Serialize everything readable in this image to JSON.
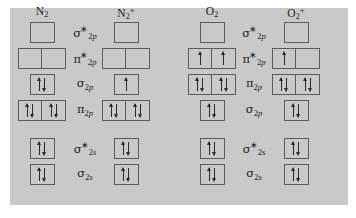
{
  "figure": {
    "type": "molecular-orbital-diagram",
    "background_color": "#ffffff",
    "panel_color": "#c9c9c9",
    "box_border_color": "#5c5c5c",
    "arrow_color": "#2a2a2a"
  },
  "groups": [
    {
      "id": "left",
      "species": [
        {
          "id": "n2",
          "base": "N",
          "sub": "2",
          "sup": ""
        },
        {
          "id": "n2plus",
          "base": "N",
          "sub": "2",
          "sup": "+"
        }
      ],
      "rows": [
        {
          "id": "sigma-star-2p",
          "label": {
            "symbol": "σ",
            "star": "∗",
            "sub_n": "2",
            "sub_l": "p"
          },
          "boxes": {
            "n2": [
              []
            ],
            "n2plus": [
              []
            ]
          }
        },
        {
          "id": "pi-star-2p",
          "label": {
            "symbol": "π",
            "star": "∗",
            "sub_n": "2",
            "sub_l": "p"
          },
          "boxes": {
            "n2": [
              [],
              []
            ],
            "n2plus": [
              [],
              []
            ]
          }
        },
        {
          "id": "sigma-2p",
          "label": {
            "symbol": "σ",
            "star": "",
            "sub_n": "2",
            "sub_l": "p"
          },
          "boxes": {
            "n2": [
              [
                "up",
                "down"
              ]
            ],
            "n2plus": [
              [
                "up"
              ]
            ]
          }
        },
        {
          "id": "pi-2p",
          "label": {
            "symbol": "π",
            "star": "",
            "sub_n": "2",
            "sub_l": "p"
          },
          "boxes": {
            "n2": [
              [
                "up",
                "down"
              ],
              [
                "up",
                "down"
              ]
            ],
            "n2plus": [
              [
                "up",
                "down"
              ],
              [
                "up",
                "down"
              ]
            ]
          }
        },
        {
          "id": "sigma-star-2s",
          "label": {
            "symbol": "σ",
            "star": "∗",
            "sub_n": "2",
            "sub_l": "s"
          },
          "boxes": {
            "n2": [
              [
                "up",
                "down"
              ]
            ],
            "n2plus": [
              [
                "up",
                "down"
              ]
            ]
          }
        },
        {
          "id": "sigma-2s",
          "label": {
            "symbol": "σ",
            "star": "",
            "sub_n": "2",
            "sub_l": "s"
          },
          "boxes": {
            "n2": [
              [
                "up",
                "down"
              ]
            ],
            "n2plus": [
              [
                "up",
                "down"
              ]
            ]
          }
        }
      ]
    },
    {
      "id": "right",
      "species": [
        {
          "id": "o2",
          "base": "O",
          "sub": "2",
          "sup": ""
        },
        {
          "id": "o2plus",
          "base": "O",
          "sub": "2",
          "sup": "+"
        }
      ],
      "rows": [
        {
          "id": "sigma-star-2p",
          "label": {
            "symbol": "σ",
            "star": "∗",
            "sub_n": "2",
            "sub_l": "p"
          },
          "boxes": {
            "o2": [
              []
            ],
            "o2plus": [
              []
            ]
          }
        },
        {
          "id": "pi-star-2p",
          "label": {
            "symbol": "π",
            "star": "∗",
            "sub_n": "2",
            "sub_l": "p"
          },
          "boxes": {
            "o2": [
              [
                "up"
              ],
              [
                "up"
              ]
            ],
            "o2plus": [
              [
                "up"
              ],
              []
            ]
          }
        },
        {
          "id": "pi-2p",
          "label": {
            "symbol": "π",
            "star": "",
            "sub_n": "2",
            "sub_l": "p"
          },
          "boxes": {
            "o2": [
              [
                "up",
                "down"
              ],
              [
                "up",
                "down"
              ]
            ],
            "o2plus": [
              [
                "up",
                "down"
              ],
              [
                "up",
                "down"
              ]
            ]
          }
        },
        {
          "id": "sigma-2p",
          "label": {
            "symbol": "σ",
            "star": "",
            "sub_n": "2",
            "sub_l": "p"
          },
          "boxes": {
            "o2": [
              [
                "up",
                "down"
              ]
            ],
            "o2plus": [
              [
                "up",
                "down"
              ]
            ]
          }
        },
        {
          "id": "sigma-star-2s",
          "label": {
            "symbol": "σ",
            "star": "∗",
            "sub_n": "2",
            "sub_l": "s"
          },
          "boxes": {
            "o2": [
              [
                "up",
                "down"
              ]
            ],
            "o2plus": [
              [
                "up",
                "down"
              ]
            ]
          }
        },
        {
          "id": "sigma-2s",
          "label": {
            "symbol": "σ",
            "star": "",
            "sub_n": "2",
            "sub_l": "s"
          },
          "boxes": {
            "o2": [
              [
                "up",
                "down"
              ]
            ],
            "o2plus": [
              [
                "up",
                "down"
              ]
            ]
          }
        }
      ]
    }
  ],
  "row_tops": [
    22,
    48,
    74,
    100,
    138,
    164
  ]
}
